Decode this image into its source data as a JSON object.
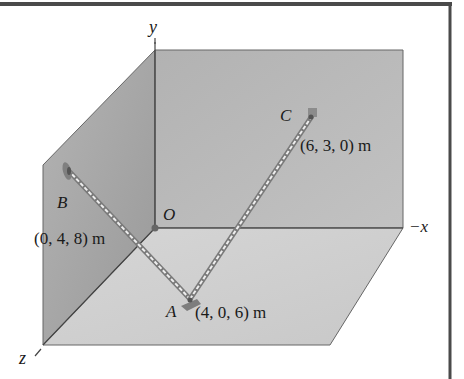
{
  "figure": {
    "type": "3D statics diagram",
    "axes": {
      "y_label": "y",
      "x_label": "−x",
      "z_label": "z",
      "origin_label": "O"
    },
    "points": [
      {
        "name": "A",
        "coords": "(4, 0, 6) m"
      },
      {
        "name": "B",
        "coords": "(0, 4, 8) m"
      },
      {
        "name": "C",
        "coords": "(6, 3, 0) m"
      }
    ],
    "cables": [
      {
        "from": "A",
        "to": "B"
      },
      {
        "from": "A",
        "to": "C"
      }
    ],
    "colors": {
      "back_wall": "#b9b9b9",
      "side_wall": "#a9a9a9",
      "floor": "#cdcdcd",
      "edge": "#555555",
      "frame": "#4a4a4a"
    }
  }
}
